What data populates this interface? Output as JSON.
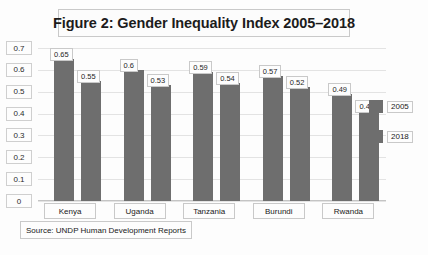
{
  "chart_data": {
    "type": "bar",
    "title": "Figure 2: Gender Inequality Index 2005–2018",
    "xlabel": "",
    "ylabel": "",
    "ylim": [
      0,
      0.7
    ],
    "ytick_labels": [
      "0.7",
      "0.6",
      "0.5",
      "0.4",
      "0.3",
      "0.2",
      "0.1",
      "0"
    ],
    "ytick_values": [
      0.7,
      0.6,
      0.5,
      0.4,
      0.3,
      0.2,
      0.1,
      0
    ],
    "grid": true,
    "legend_position": "right",
    "categories": [
      "Kenya",
      "Uganda",
      "Tanzania",
      "Burundi",
      "Rwanda"
    ],
    "series": [
      {
        "name": "2005",
        "color": "#6e6e6e",
        "values": [
          0.65,
          0.6,
          0.59,
          0.57,
          0.49
        ],
        "labels": [
          "0.65",
          "0.6",
          "0.59",
          "0.57",
          "0.49"
        ]
      },
      {
        "name": "2018",
        "color": "#6e6e6e",
        "values": [
          0.55,
          0.53,
          0.54,
          0.52,
          0.41
        ],
        "labels": [
          "0.55",
          "0.53",
          "0.54",
          "0.52",
          "0.41"
        ]
      }
    ],
    "source_note": "Source: UNDP Human Development Reports"
  }
}
